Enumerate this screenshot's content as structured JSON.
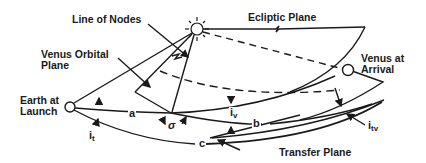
{
  "labels": {
    "line_of_nodes": "Line of Nodes",
    "ecliptic_plane": "Ecliptic Plane",
    "venus_orbital_plane_1": "Venus Orbital",
    "venus_orbital_plane_2": "Plane",
    "venus_at_arrival_1": "Venus at",
    "venus_at_arrival_2": "Arrival",
    "earth_at_launch_1": "Earth at",
    "earth_at_launch_2": "Launch",
    "transfer_plane": "Transfer Plane"
  },
  "symbols": {
    "a": "a",
    "b": "b",
    "c": "c",
    "sigma": "σ",
    "i_v": "i",
    "i_v_sub": "v",
    "i_t": "i",
    "i_t_sub": "t",
    "i_tv": "i",
    "i_tv_sub": "tv"
  },
  "bodies": {
    "sun": "sun-icon",
    "earth": "earth-circle",
    "venus": "venus-circle"
  },
  "colors": {
    "ink": "#1a1a1a",
    "background": "#ffffff"
  }
}
